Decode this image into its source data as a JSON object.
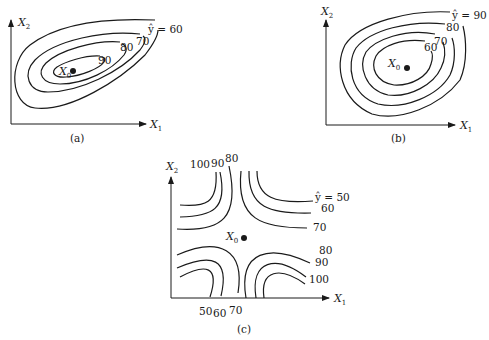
{
  "figure": {
    "panels": [
      {
        "id": "a",
        "caption": "(a)",
        "x_axis": {
          "label": "X",
          "sub": "1"
        },
        "y_axis": {
          "label": "X",
          "sub": "2"
        },
        "stationary_point": {
          "label": "X",
          "sub": "0"
        },
        "contour_labels": [
          "ŷ = 60",
          "70",
          "80",
          "90"
        ],
        "description": "Elongated tilted ellipses; maximum at X0"
      },
      {
        "id": "b",
        "caption": "(b)",
        "x_axis": {
          "label": "X",
          "sub": "1"
        },
        "y_axis": {
          "label": "X",
          "sub": "2"
        },
        "stationary_point": {
          "label": "X",
          "sub": "0"
        },
        "contour_labels": [
          "ŷ = 90",
          "80",
          "70",
          "60"
        ],
        "description": "Concentric ellipses; minimum at X0"
      },
      {
        "id": "c",
        "caption": "(c)",
        "x_axis": {
          "label": "X",
          "sub": "1"
        },
        "y_axis": {
          "label": "X",
          "sub": "2"
        },
        "stationary_point": {
          "label": "X",
          "sub": "0"
        },
        "contour_labels_top": [
          "100",
          "90",
          "80"
        ],
        "contour_labels_right": [
          "ŷ = 50",
          "60",
          "70",
          "80",
          "90",
          "100"
        ],
        "contour_labels_bottom": [
          "50",
          "60",
          "70"
        ],
        "description": "Hyperbolic contours; saddle point at X0"
      }
    ]
  }
}
